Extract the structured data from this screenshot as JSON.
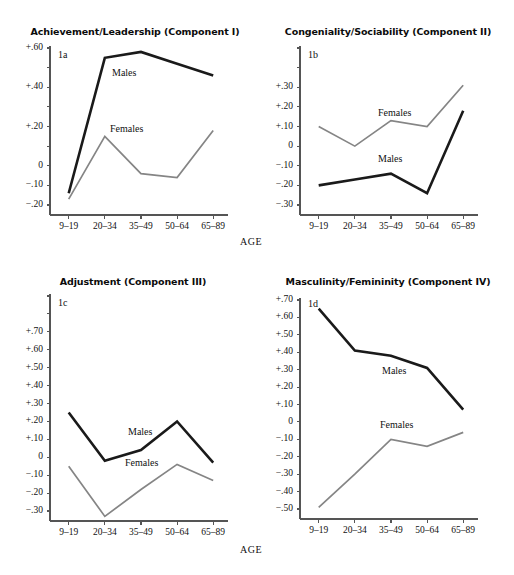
{
  "figure": {
    "axis_label_bottom_left": "AGE",
    "axis_label_bottom_right": "AGE",
    "colors": {
      "males_line": "#1a1a1a",
      "females_line": "#858585",
      "axis": "#555555",
      "text": "#111111",
      "background": "#ffffff"
    }
  },
  "chart_data": [
    {
      "id": "1a",
      "panel_code": "1a",
      "type": "line",
      "title": "Achievement/Leadership (Component I)",
      "xlabel": "AGE",
      "ylabel": "",
      "categories": [
        "9–19",
        "20–34",
        "35–49",
        "50–64",
        "65–89"
      ],
      "ytick_labels": [
        "+.60",
        "",
        "+.40",
        "",
        "+.20",
        "",
        "0",
        "−.10",
        "−.20"
      ],
      "ytick_values": [
        0.6,
        0.5,
        0.4,
        0.3,
        0.2,
        0.1,
        0.0,
        -0.1,
        -0.2
      ],
      "ylim": [
        -0.2,
        0.6
      ],
      "grid": false,
      "legend": "inline-labels",
      "series": [
        {
          "name": "Males",
          "label": "Males",
          "color": "#1a1a1a",
          "values": [
            -0.14,
            0.55,
            0.58,
            0.52,
            0.46
          ]
        },
        {
          "name": "Females",
          "label": "Females",
          "color": "#858585",
          "values": [
            -0.17,
            0.15,
            -0.04,
            -0.06,
            0.18
          ]
        }
      ]
    },
    {
      "id": "1b",
      "panel_code": "1b",
      "type": "line",
      "title": "Congeniality/Sociability (Component II)",
      "xlabel": "AGE",
      "ylabel": "",
      "categories": [
        "9–19",
        "20–34",
        "35–49",
        "50–64",
        "65–89"
      ],
      "ytick_labels": [
        "",
        "",
        "+.30",
        "+.20",
        "+.10",
        "0",
        "−.10",
        "−.20",
        "−.30"
      ],
      "ytick_values": [
        0.5,
        0.4,
        0.3,
        0.2,
        0.1,
        0.0,
        -0.1,
        -0.2,
        -0.3
      ],
      "ylim": [
        -0.3,
        0.5
      ],
      "grid": false,
      "legend": "inline-labels",
      "series": [
        {
          "name": "Males",
          "label": "Males",
          "color": "#1a1a1a",
          "values": [
            -0.2,
            -0.17,
            -0.14,
            -0.24,
            0.18
          ]
        },
        {
          "name": "Females",
          "label": "Females",
          "color": "#858585",
          "values": [
            0.1,
            0.0,
            0.13,
            0.1,
            0.31
          ]
        }
      ]
    },
    {
      "id": "1c",
      "panel_code": "1c",
      "type": "line",
      "title": "Adjustment (Component III)",
      "xlabel": "AGE",
      "ylabel": "",
      "categories": [
        "9–19",
        "20–34",
        "35–49",
        "50–64",
        "65–89"
      ],
      "ytick_labels": [
        "",
        "",
        "+.70",
        "+.60",
        "+.50",
        "+.40",
        "+.30",
        "+.20",
        "+.10",
        "0",
        "−.10",
        "−.20",
        "−.30"
      ],
      "ytick_values": [
        0.9,
        0.8,
        0.7,
        0.6,
        0.5,
        0.4,
        0.3,
        0.2,
        0.1,
        0.0,
        -0.1,
        -0.2,
        -0.3
      ],
      "ylim": [
        -0.3,
        0.9
      ],
      "grid": false,
      "legend": "inline-labels",
      "series": [
        {
          "name": "Males",
          "label": "Males",
          "color": "#1a1a1a",
          "values": [
            0.25,
            -0.02,
            0.04,
            0.2,
            -0.03
          ]
        },
        {
          "name": "Females",
          "label": "Females",
          "color": "#858585",
          "values": [
            -0.05,
            -0.33,
            -0.18,
            -0.04,
            -0.13
          ]
        }
      ]
    },
    {
      "id": "1d",
      "panel_code": "1d",
      "type": "line",
      "title": "Masculinity/Femininity (Component IV)",
      "xlabel": "AGE",
      "ylabel": "",
      "categories": [
        "9–19",
        "20–34",
        "35–49",
        "50–64",
        "65–89"
      ],
      "ytick_labels": [
        "+.70",
        "+.60",
        "+.50",
        "+.40",
        "+.30",
        "+.20",
        "+.10",
        "0",
        "−.10",
        "−.20",
        "−.30",
        "−.40",
        "−.50"
      ],
      "ytick_values": [
        0.7,
        0.6,
        0.5,
        0.4,
        0.3,
        0.2,
        0.1,
        0.0,
        -0.1,
        -0.2,
        -0.3,
        -0.4,
        -0.5
      ],
      "ylim": [
        -0.5,
        0.7
      ],
      "grid": false,
      "legend": "inline-labels",
      "series": [
        {
          "name": "Males",
          "label": "Males",
          "color": "#1a1a1a",
          "values": [
            0.65,
            0.41,
            0.38,
            0.31,
            0.07
          ]
        },
        {
          "name": "Females",
          "label": "Females",
          "color": "#858585",
          "values": [
            -0.49,
            -0.3,
            -0.1,
            -0.14,
            -0.06
          ]
        }
      ]
    }
  ]
}
